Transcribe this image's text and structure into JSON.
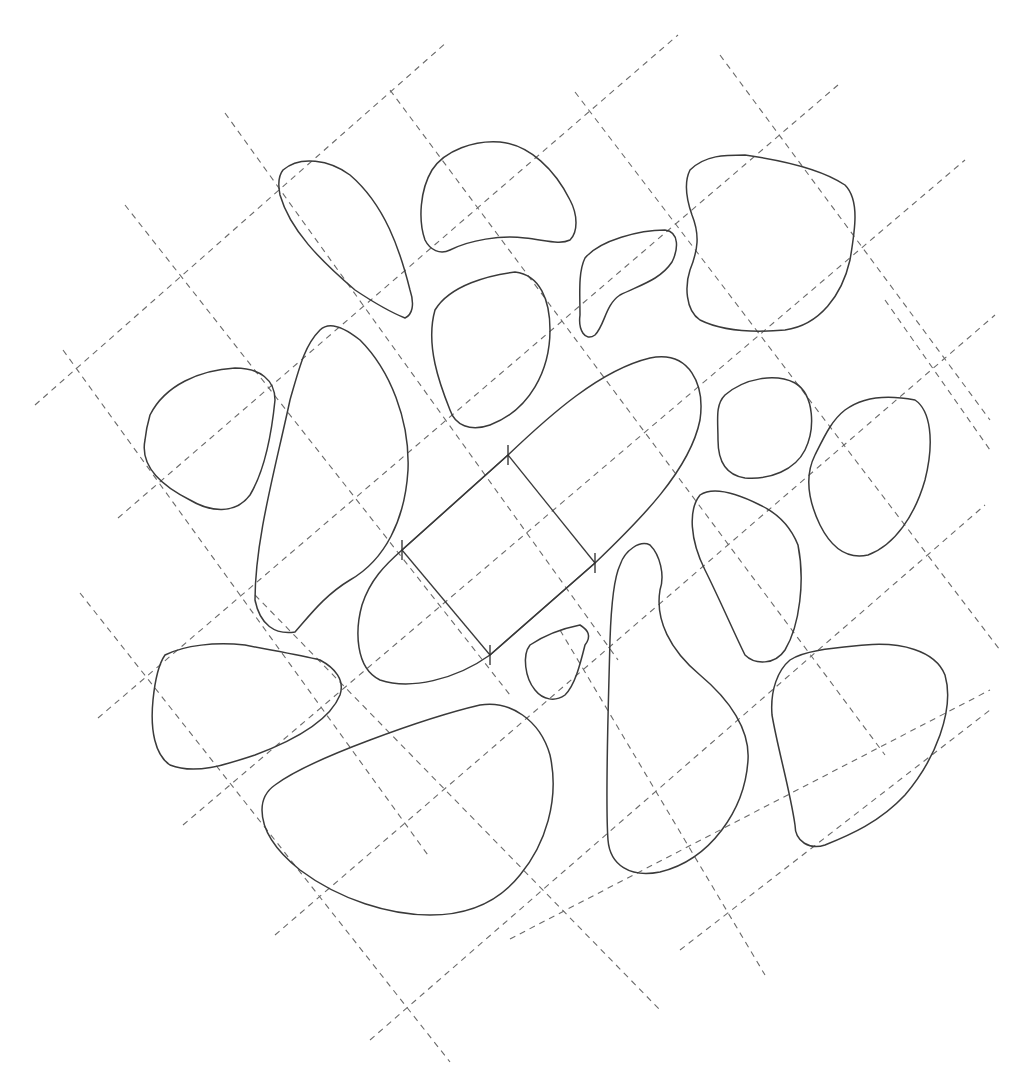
{
  "figure": {
    "width": 1035,
    "height": 1077,
    "background": "#ffffff",
    "colors": {
      "outline": "#3a3a3a",
      "grid": "#6a6a6a"
    },
    "grid_lines": {
      "slash": [
        [
          35,
          405,
          447,
          42
        ],
        [
          118,
          518,
          678,
          35
        ],
        [
          98,
          718,
          838,
          85
        ],
        [
          183,
          825,
          965,
          160
        ],
        [
          275,
          935,
          995,
          315
        ],
        [
          370,
          1040,
          985,
          505
        ],
        [
          510,
          939,
          990,
          690
        ],
        [
          680,
          950,
          990,
          710
        ]
      ],
      "backslash": [
        [
          225,
          113,
          618,
          660
        ],
        [
          125,
          205,
          510,
          695
        ],
        [
          63,
          350,
          430,
          858
        ],
        [
          80,
          593,
          450,
          1062
        ],
        [
          390,
          90,
          885,
          755
        ],
        [
          575,
          92,
          1000,
          650
        ],
        [
          720,
          55,
          990,
          420
        ],
        [
          885,
          300,
          990,
          450
        ],
        [
          560,
          630,
          765,
          975
        ],
        [
          255,
          595,
          660,
          1010
        ]
      ]
    },
    "blobs": [
      {
        "name": "blob-top-left-leaf",
        "d": "M283,170 C300,155 330,160 350,175 C385,205 400,250 410,290 C415,305 412,315 405,318 C390,312 370,300 355,290 C320,260 290,230 280,195 C278,185 279,175 283,170 Z"
      },
      {
        "name": "blob-top-center",
        "d": "M432,170 C445,150 475,140 500,142 C530,145 555,170 570,200 C578,215 578,232 570,240 C560,245 545,240 525,238 C500,235 470,240 450,250 C440,255 430,250 425,240 C418,220 420,190 432,170 Z"
      },
      {
        "name": "blob-top-right",
        "d": "M690,170 C705,155 725,155 745,155 C780,160 820,168 845,185 C860,200 855,230 850,260 C842,295 820,325 785,330 C750,333 720,330 700,320 C685,310 685,285 690,270 C698,250 700,235 692,215 C685,195 685,180 690,170 Z"
      },
      {
        "name": "blob-kidney",
        "d": "M585,258 C600,240 640,230 665,230 C680,232 678,250 672,262 C660,280 640,285 620,295 C605,305 605,325 595,335 C585,342 578,330 580,315 C580,295 578,272 585,258 Z"
      },
      {
        "name": "blob-upper-middle",
        "d": "M435,310 C450,285 490,275 515,272 C540,275 550,300 550,330 C550,370 530,410 490,425 C470,432 455,425 450,410 C440,385 425,345 435,310 Z"
      },
      {
        "name": "blob-left-rounded",
        "d": "M150,415 C165,385 200,370 235,368 C260,368 275,380 275,400 C272,430 265,470 250,495 C235,515 210,512 190,500 C160,485 140,465 145,440 C146,430 148,422 150,415 Z"
      },
      {
        "name": "blob-tall-left",
        "d": "M320,330 C330,320 345,328 360,340 C390,370 410,420 408,470 C405,520 385,560 350,580 C325,595 310,615 295,632 C275,635 260,625 255,600 C255,540 275,470 290,400 C300,365 305,345 320,330 Z"
      },
      {
        "name": "blob-small-circle",
        "d": "M725,395 C745,378 775,373 795,383 C815,395 815,430 805,450 C795,470 770,480 745,478 C725,475 718,460 718,440 C718,420 715,405 725,395 Z"
      },
      {
        "name": "blob-right-oval",
        "d": "M845,410 C865,395 890,395 915,400 C930,410 935,440 925,480 C915,515 895,545 868,555 C845,560 830,545 820,525 C808,500 805,475 815,455 C825,435 832,420 845,410 Z"
      },
      {
        "name": "blob-right-middle",
        "d": "M700,495 C715,485 740,495 760,505 C775,512 790,525 798,545 C805,580 800,625 785,650 C775,665 755,665 745,655 C735,635 720,600 705,570 C690,540 688,510 700,495 Z"
      },
      {
        "name": "blob-center-capsule",
        "d": "M402,550 L508,455 C550,415 600,370 650,358 C690,350 705,385 700,420 C690,470 640,520 595,563 L490,655 C455,680 410,690 380,680 C355,668 355,630 362,605 C370,580 385,565 402,550 Z"
      },
      {
        "name": "blob-small-triangle",
        "d": "M530,645 C545,635 565,628 580,625 C588,630 592,636 585,645 C580,665 575,685 565,695 C555,702 543,700 535,690 C525,678 522,655 530,645 Z"
      },
      {
        "name": "blob-tall-drop",
        "d": "M620,565 C625,550 640,540 650,545 C660,555 665,575 660,590 C655,620 670,650 700,675 C730,700 750,730 748,760 C745,810 710,860 660,872 C630,878 610,865 608,840 C605,800 608,720 610,640 C611,610 613,580 620,565 Z"
      },
      {
        "name": "blob-bottom-left",
        "d": "M165,655 C185,645 215,642 245,645 C270,650 300,655 320,660 C335,668 345,680 340,695 C330,720 295,740 255,755 C225,765 195,775 170,765 C155,755 150,730 153,700 C155,680 158,665 165,655 Z"
      },
      {
        "name": "blob-bottom-right",
        "d": "M790,660 C805,650 835,648 865,645 C900,642 935,650 945,675 C955,710 935,760 905,795 C880,822 850,835 825,845 C810,850 795,842 795,825 C790,790 778,750 772,715 C770,690 778,670 790,660 Z"
      },
      {
        "name": "blob-bottom-large",
        "d": "M275,785 C295,770 330,755 370,740 C410,725 450,712 480,705 C510,700 540,720 550,755 C560,800 545,845 520,875 C500,900 470,915 430,915 C390,915 340,900 300,870 C275,850 262,830 262,810 C262,800 265,792 275,785 Z"
      }
    ],
    "center_rectangle": {
      "corners": [
        [
          402,
          550
        ],
        [
          508,
          455
        ],
        [
          595,
          563
        ],
        [
          490,
          655
        ]
      ],
      "tick_length": 10
    }
  }
}
